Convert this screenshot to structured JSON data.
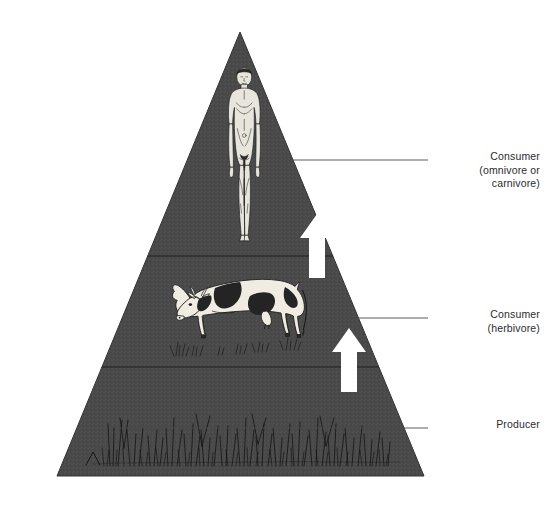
{
  "diagram": {
    "background_color": "#ffffff",
    "pyramid_fill": "#4a4a4a",
    "pyramid_outline": "#2e2e2e",
    "label_color": "#2b2b2b",
    "arrow_color": "#ffffff",
    "apex": {
      "x": 240,
      "y": 32
    },
    "base_left": {
      "x": 57,
      "y": 476
    },
    "base_right": {
      "x": 424,
      "y": 476
    },
    "divider_y": [
      256,
      367
    ]
  },
  "levels": [
    {
      "id": "consumer-omnivore-carnivore",
      "label": "Consumer\n(omnivore or\ncarnivore)",
      "label_line1": "Consumer",
      "label_line2": "(omnivore or",
      "label_line3": "carnivore)",
      "organism_icon": "human-figure-icon",
      "organism_name": "human",
      "trophic_rank": 3,
      "leader_line": {
        "x1": 285,
        "y1": 160,
        "x2": 424,
        "y2": 160
      }
    },
    {
      "id": "consumer-herbivore",
      "label": "Consumer\n(herbivore)",
      "label_line1": "Consumer",
      "label_line2": "(herbivore)",
      "organism_icon": "cow-icon",
      "organism_name": "cow",
      "trophic_rank": 2,
      "leader_line": {
        "x1": 343,
        "y1": 318,
        "x2": 424,
        "y2": 318
      }
    },
    {
      "id": "producer",
      "label": "Producer",
      "label_line1": "Producer",
      "organism_icon": "grass-icon",
      "organism_name": "grass",
      "trophic_rank": 1,
      "leader_line": {
        "x1": 120,
        "y1": 428,
        "x2": 424,
        "y2": 428
      }
    }
  ],
  "arrows": [
    {
      "id": "energy-flow-arrow-upper",
      "icon": "arrow-up-icon",
      "from_level": "consumer-herbivore",
      "to_level": "consumer-omnivore-carnivore",
      "x": 317,
      "y_top": 216,
      "y_bottom": 277
    },
    {
      "id": "energy-flow-arrow-lower",
      "icon": "arrow-up-icon",
      "from_level": "producer",
      "to_level": "consumer-herbivore",
      "x": 349,
      "y_top": 330,
      "y_bottom": 392
    }
  ]
}
